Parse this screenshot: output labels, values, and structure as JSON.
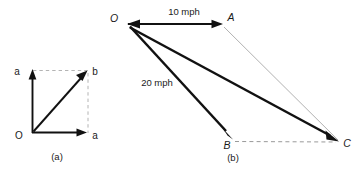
{
  "figure": {
    "stroke_color": "#111111",
    "dash_color": "#9a9a9a",
    "hairline_color": "#a8a8a8",
    "background": "#ffffff"
  },
  "panel_a": {
    "caption": "(a)",
    "origin_label": "O",
    "vertical_tip_label": "a",
    "horizontal_tip_label": "a",
    "diagonal_tip_label": "b",
    "vectors": [
      {
        "name": "vertical",
        "from": [
          32,
          133
        ],
        "to": [
          32,
          72
        ],
        "label": "a",
        "style": "solid-arrow"
      },
      {
        "name": "horizontal",
        "from": [
          32,
          133
        ],
        "to": [
          85,
          133
        ],
        "label": "a",
        "style": "solid-arrow"
      },
      {
        "name": "resultant-diagonal",
        "from": [
          32,
          133
        ],
        "to": [
          87,
          71
        ],
        "label": "b",
        "style": "solid-arrow"
      }
    ],
    "construction_lines": [
      {
        "name": "top-dashed",
        "from": [
          32,
          70
        ],
        "to": [
          88,
          70
        ]
      },
      {
        "name": "right-dashed",
        "from": [
          88,
          72
        ],
        "to": [
          88,
          133
        ]
      }
    ]
  },
  "panel_b": {
    "caption": "(b)",
    "origin_label": "O",
    "point_a_label": "A",
    "point_b_label": "B",
    "point_c_label": "C",
    "speed_oa": "10 mph",
    "speed_ob": "20 mph",
    "vectors": [
      {
        "name": "OA",
        "from": [
          128,
          24
        ],
        "to": [
          222,
          24
        ],
        "label": "10 mph",
        "style": "solid-arrow"
      },
      {
        "name": "OB",
        "from": [
          128,
          26
        ],
        "to": [
          232,
          139
        ],
        "label": "20 mph",
        "style": "solid-arrow-thick"
      },
      {
        "name": "OC",
        "from": [
          128,
          28
        ],
        "to": [
          338,
          141
        ],
        "label": "",
        "style": "solid-arrow-thick"
      },
      {
        "name": "arrow-into-O",
        "from": [
          160,
          24
        ],
        "to": [
          128,
          24
        ],
        "label": "",
        "style": "reverse-arrowhead"
      }
    ],
    "construction_lines": [
      {
        "name": "AC-hairline",
        "from": [
          223,
          27
        ],
        "to": [
          338,
          140
        ]
      },
      {
        "name": "BC-dashed",
        "from": [
          234,
          141
        ],
        "to": [
          336,
          142
        ]
      }
    ]
  }
}
